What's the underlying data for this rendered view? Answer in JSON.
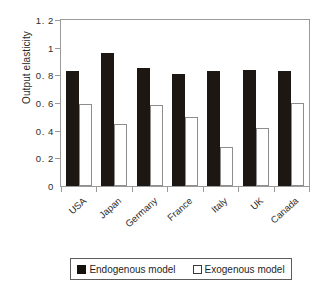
{
  "chart_data": {
    "type": "bar",
    "title": "",
    "subtitle": "",
    "xlabel": "",
    "ylabel": "Output elasticity",
    "ylim": [
      0,
      1.2
    ],
    "yticks": [
      "0",
      "0. 2",
      "0. 4",
      "0. 6",
      "0. 8",
      "1",
      "1. 2"
    ],
    "ytick_values": [
      0,
      0.2,
      0.4,
      0.6,
      0.8,
      1,
      1.2
    ],
    "grid": false,
    "legend_position": "bottom",
    "categories": [
      "USA",
      "Japan",
      "Germany",
      "France",
      "Italy",
      "UK",
      "Canada"
    ],
    "series": [
      {
        "name": "Endogenous model",
        "color": "#1c1712",
        "values": [
          0.83,
          0.96,
          0.855,
          0.81,
          0.83,
          0.84,
          0.835
        ]
      },
      {
        "name": "Exogenous model",
        "color": "#ffffff",
        "values": [
          0.595,
          0.45,
          0.585,
          0.5,
          0.285,
          0.42,
          0.6
        ]
      }
    ]
  },
  "legend": {
    "entries": [
      {
        "label": "Endogenous model",
        "swatch": "filled-square-icon"
      },
      {
        "label": "Exogenous model",
        "swatch": "hollow-square-icon"
      }
    ]
  }
}
